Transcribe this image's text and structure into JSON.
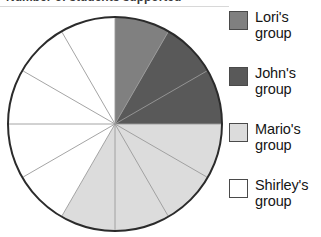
{
  "title": {
    "text": "Number of students supported",
    "clipped": true
  },
  "legend": {
    "position": "right",
    "items": [
      {
        "label_line1": "Lori's",
        "label_line2": "group",
        "color": "#808080",
        "name": "Lori's group"
      },
      {
        "label_line1": "John's",
        "label_line2": "group",
        "color": "#595959",
        "name": "John's group"
      },
      {
        "label_line1": "Mario's",
        "label_line2": "group",
        "color": "#dcdcdc",
        "name": "Mario's group"
      },
      {
        "label_line1": "Shirley's",
        "label_line2": "group",
        "color": "#ffffff",
        "name": "Shirley's group"
      }
    ]
  },
  "chart_data": {
    "type": "pie",
    "title": "Number of students supported",
    "xlabel": "",
    "ylabel": "",
    "start_angle_deg": 0,
    "direction": "clockwise",
    "total_segments": 12,
    "segment_angle_deg": 30,
    "center": {
      "x": 115,
      "y": 124
    },
    "radius": 107,
    "outline_color": "#2b2b2b",
    "divider_color": "#9a9a9a",
    "categories": [
      "Lori's group",
      "John's group",
      "Mario's group",
      "Shirley's group"
    ],
    "values": [
      1,
      2,
      4,
      5
    ],
    "percentages": [
      8.3,
      16.7,
      33.3,
      41.7
    ],
    "colors": [
      "#808080",
      "#595959",
      "#dcdcdc",
      "#ffffff"
    ],
    "slices": [
      {
        "label": "Lori's group",
        "value": 1,
        "start_deg": 0,
        "end_deg": 30,
        "color": "#808080"
      },
      {
        "label": "John's group",
        "value": 2,
        "start_deg": 30,
        "end_deg": 90,
        "color": "#595959"
      },
      {
        "label": "Mario's group",
        "value": 4,
        "start_deg": 90,
        "end_deg": 210,
        "color": "#dcdcdc"
      },
      {
        "label": "Shirley's group",
        "value": 5,
        "start_deg": 210,
        "end_deg": 360,
        "color": "#ffffff"
      }
    ],
    "dividers_deg": [
      0,
      30,
      60,
      90,
      120,
      150,
      180,
      210,
      240,
      270,
      300,
      330
    ],
    "legend_position": "right",
    "grid": false
  }
}
